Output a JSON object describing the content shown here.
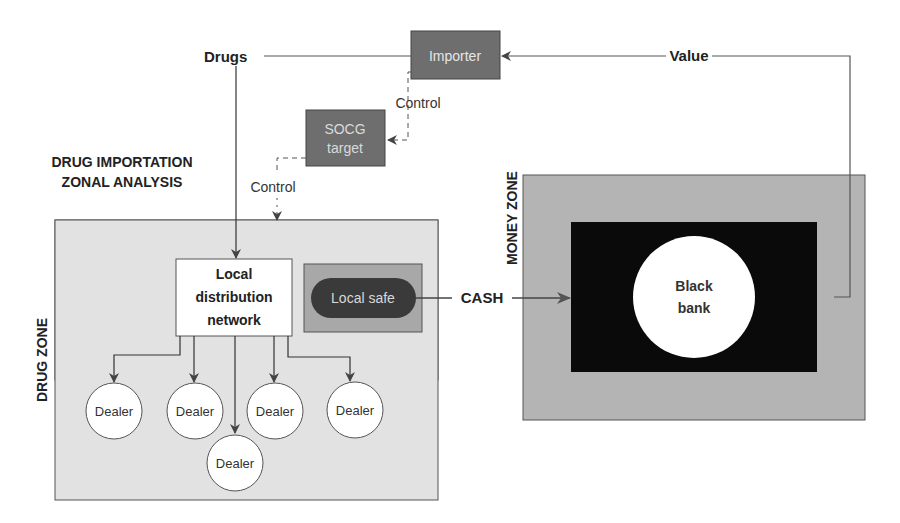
{
  "diagram": {
    "title_line1": "DRUG IMPORTATION",
    "title_line2": "ZONAL ANALYSIS",
    "nodes": {
      "importer": "Importer",
      "socg_line1": "SOCG",
      "socg_line2": "target",
      "local_network_line1": "Local",
      "local_network_line2": "distribution",
      "local_network_line3": "network",
      "local_safe": "Local safe",
      "black_bank_line1": "Black",
      "black_bank_line2": "bank",
      "dealers": [
        "Dealer",
        "Dealer",
        "Dealer",
        "Dealer",
        "Dealer"
      ]
    },
    "edge_labels": {
      "drugs": "Drugs",
      "value": "Value",
      "control_1": "Control",
      "control_2": "Control",
      "cash": "CASH"
    },
    "zones": {
      "drug_zone": "DRUG ZONE",
      "money_zone": "MONEY ZONE"
    },
    "colors": {
      "zone_light": "#e2e2e2",
      "zone_money": "#b4b4b4",
      "dark_box": "#6e6e6e",
      "black_panel": "#0a0a0a",
      "line": "#4a4a4a"
    }
  }
}
